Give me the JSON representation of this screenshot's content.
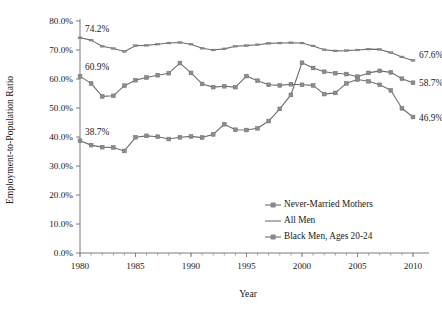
{
  "chart_data": {
    "type": "line",
    "title": "",
    "xlabel": "Year",
    "ylabel": "Employment-to-Population Ratio",
    "xlim": [
      1980,
      2010
    ],
    "ylim": [
      0,
      0.8
    ],
    "grid": false,
    "legend_position": "inside-bottom-right",
    "x": [
      1980,
      1981,
      1982,
      1983,
      1984,
      1985,
      1986,
      1987,
      1988,
      1989,
      1990,
      1991,
      1992,
      1993,
      1994,
      1995,
      1996,
      1997,
      1998,
      1999,
      2000,
      2001,
      2002,
      2003,
      2004,
      2005,
      2006,
      2007,
      2008,
      2009,
      2010
    ],
    "y_tick_labels": [
      "0.0%",
      "10.0%",
      "20.0%",
      "30.0%",
      "40.0%",
      "50.0%",
      "60.0%",
      "70.0%",
      "80.0%"
    ],
    "y_tick_values": [
      0.0,
      0.1,
      0.2,
      0.3,
      0.4,
      0.5,
      0.6,
      0.7,
      0.8
    ],
    "x_tick_labels": [
      "1980",
      "1985",
      "1990",
      "1995",
      "2000",
      "2005",
      "2010"
    ],
    "x_tick_values": [
      1980,
      1985,
      1990,
      1995,
      2000,
      2005,
      2010
    ],
    "series": [
      {
        "name": "Never-Married Mothers",
        "marker": "square",
        "color": "#8c8c8c",
        "values": [
          0.387,
          0.372,
          0.365,
          0.364,
          0.352,
          0.399,
          0.404,
          0.401,
          0.393,
          0.399,
          0.402,
          0.398,
          0.409,
          0.444,
          0.425,
          0.424,
          0.43,
          0.455,
          0.497,
          0.545,
          0.656,
          0.638,
          0.625,
          0.62,
          0.617,
          0.608,
          0.621,
          0.628,
          0.623,
          0.601,
          0.587
        ]
      },
      {
        "name": "All Men",
        "marker": "dash",
        "color": "#8c8c8c",
        "values": [
          0.742,
          0.734,
          0.713,
          0.705,
          0.695,
          0.715,
          0.716,
          0.72,
          0.724,
          0.726,
          0.72,
          0.706,
          0.7,
          0.704,
          0.713,
          0.715,
          0.718,
          0.723,
          0.724,
          0.725,
          0.724,
          0.714,
          0.701,
          0.697,
          0.698,
          0.7,
          0.703,
          0.702,
          0.691,
          0.676,
          0.664
        ]
      },
      {
        "name": "Black Men, Ages 20-24",
        "marker": "square",
        "color": "#8c8c8c",
        "values": [
          0.609,
          0.585,
          0.54,
          0.542,
          0.577,
          0.596,
          0.605,
          0.613,
          0.62,
          0.655,
          0.621,
          0.583,
          0.572,
          0.575,
          0.572,
          0.61,
          0.594,
          0.58,
          0.578,
          0.582,
          0.58,
          0.578,
          0.548,
          0.552,
          0.585,
          0.598,
          0.592,
          0.58,
          0.561,
          0.499,
          0.469
        ]
      }
    ],
    "endpoint_labels": [
      {
        "text": "74.2%",
        "series": "All Men",
        "at_x": 1980,
        "value": 0.742
      },
      {
        "text": "60.9%",
        "series": "Black Men, Ages 20-24",
        "at_x": 1980,
        "value": 0.609
      },
      {
        "text": "38.7%",
        "series": "Never-Married Mothers",
        "at_x": 1980,
        "value": 0.387
      },
      {
        "text": "67.6%",
        "series": "All Men",
        "at_x": 2010,
        "value": 0.664
      },
      {
        "text": "58.7%",
        "series": "Never-Married Mothers",
        "at_x": 2010,
        "value": 0.587
      },
      {
        "text": "46.9%",
        "series": "Black Men, Ages 20-24",
        "at_x": 2010,
        "value": 0.469
      }
    ],
    "legend": [
      {
        "label": "Never-Married Mothers",
        "marker": "square"
      },
      {
        "label": "All Men",
        "marker": "dash"
      },
      {
        "label": "Black Men, Ages 20-24",
        "marker": "square"
      }
    ]
  }
}
